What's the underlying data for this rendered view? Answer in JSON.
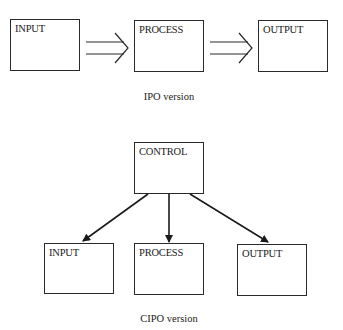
{
  "ipo": {
    "boxes": [
      {
        "label": "INPUT"
      },
      {
        "label": "PROCESS"
      },
      {
        "label": "OUTPUT"
      }
    ],
    "caption": "IPO version"
  },
  "cipo": {
    "control": {
      "label": "CONTROL"
    },
    "boxes": [
      {
        "label": "INPUT"
      },
      {
        "label": "PROCESS"
      },
      {
        "label": "OUTPUT"
      }
    ],
    "caption": "CIPO version"
  }
}
